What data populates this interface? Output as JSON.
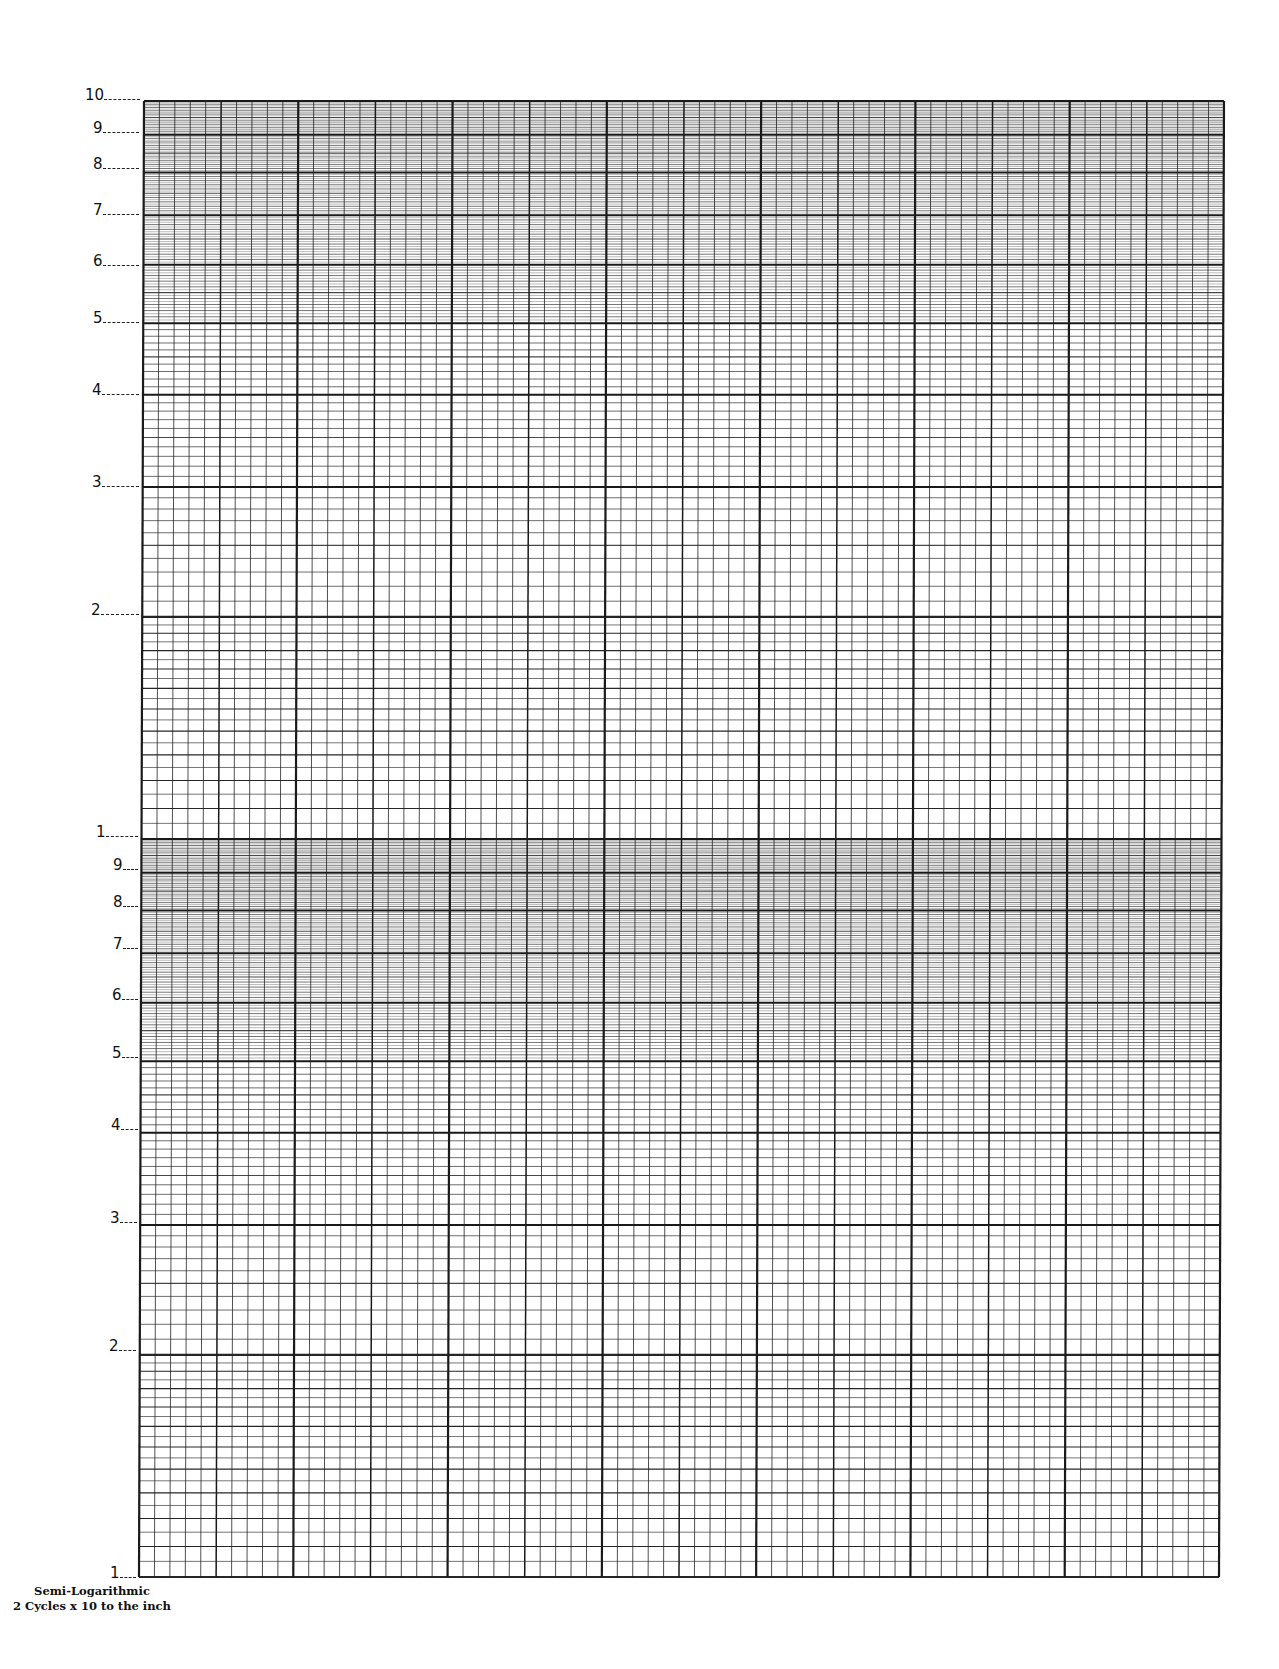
{
  "page": {
    "type": "Semi-logarithmic graph paper",
    "caption_line1": "Semi-Logarithmic",
    "caption_line2": "2 Cycles x 10 to the inch"
  },
  "grid": {
    "left": 144,
    "right": 1224,
    "top": 101,
    "bottom": 1577,
    "skew_px": -5,
    "columns": 70,
    "columns_per_major": 10,
    "columns_per_medium": 5,
    "cycles": 2,
    "line_color": "#1a1a1a"
  },
  "y_axis": {
    "top_cycle_labels": [
      "10",
      "9",
      "8",
      "7",
      "6",
      "5",
      "4",
      "3",
      "2",
      "1"
    ],
    "bottom_cycle_labels": [
      "9",
      "8",
      "7",
      "6",
      "5",
      "4",
      "3",
      "2",
      "1"
    ]
  },
  "chart_data": {
    "type": "table",
    "title": "Semi-Logarithmic 2 Cycles x 10 to the inch",
    "xlabel": "",
    "ylabel": "",
    "x_scale": "linear",
    "y_scale": "log",
    "y_cycles": 2,
    "x_divisions": 70,
    "x_divisions_per_inch": 10,
    "y_tick_labels_top_cycle": [
      10,
      9,
      8,
      7,
      6,
      5,
      4,
      3,
      2,
      1
    ],
    "y_tick_labels_bottom_cycle": [
      9,
      8,
      7,
      6,
      5,
      4,
      3,
      2,
      1
    ],
    "ylim": [
      1,
      100
    ],
    "grid": true,
    "series": []
  }
}
